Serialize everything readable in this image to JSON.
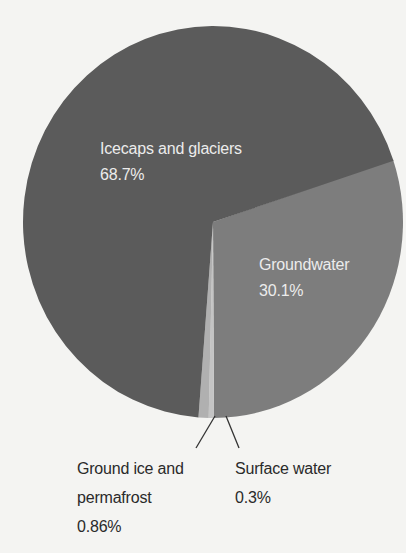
{
  "chart_data": {
    "type": "pie",
    "title": "",
    "categories": [
      "Icecaps and glaciers",
      "Groundwater",
      "Ground ice and permafrost",
      "Surface water"
    ],
    "values": [
      68.7,
      30.1,
      0.86,
      0.3
    ],
    "value_labels": [
      "68.7%",
      "30.1%",
      "0.86%",
      "0.3%"
    ],
    "colors": [
      "#5b5b5b",
      "#7d7d7d",
      "#b0b0b0",
      "#c4c4c4"
    ],
    "legend": "none (direct labels)"
  },
  "labels": {
    "icecaps": {
      "name": "Icecaps and glaciers",
      "value": "68.7%"
    },
    "groundwater": {
      "name": "Groundwater",
      "value": "30.1%"
    },
    "ground_ice": {
      "name_line1": "Ground ice and",
      "name_line2": "permafrost",
      "value": "0.86%"
    },
    "surface_water": {
      "name": "Surface water",
      "value": "0.3%"
    }
  }
}
